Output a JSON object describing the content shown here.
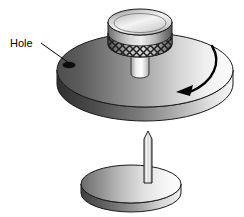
{
  "figure": {
    "type": "technical-line-illustration",
    "background_color": "#ffffff",
    "width": 244,
    "height": 217
  },
  "annotations": {
    "hole_label": {
      "text": "Hole",
      "x": 10,
      "y": 47,
      "font_size": 11,
      "color": "#000000"
    },
    "leader_line": {
      "from_x": 41,
      "from_y": 44,
      "to_x": 68,
      "to_y": 64,
      "color": "#000000"
    },
    "rotation_arrow": {
      "description": "curved clockwise rotation arrow over upper disc",
      "direction": "clockwise",
      "arrowhead_x": 176,
      "arrowhead_y": 92,
      "color": "#000000"
    }
  },
  "parts": {
    "knob": {
      "name": "knurled knob",
      "top_ellipse_cx": 140,
      "top_ellipse_cy": 22,
      "top_rx": 32,
      "top_ry": 13,
      "body_bottom_y": 55,
      "knurl_pattern": "cross-hatch diamond",
      "fill_light": "#f2f2f2",
      "fill_dark": "#4a4a4a"
    },
    "knob_shaft": {
      "name": "knob shaft",
      "x": 131,
      "y": 52,
      "width": 18,
      "height": 26,
      "fill_light": "#fafafa",
      "fill_dark": "#9a9a9a"
    },
    "upper_disc": {
      "name": "upper rotating disc",
      "cx": 145,
      "cy": 70,
      "rx": 88,
      "ry": 37,
      "thickness": 14,
      "fill_left": "#545454",
      "fill_right": "#fbfbfb",
      "rim_fill_dark": "#3c3c3c"
    },
    "hole": {
      "name": "hole in upper disc",
      "cx": 69,
      "cy": 65,
      "rx": 6,
      "ry": 3,
      "fill": "#111111"
    },
    "lower_disc": {
      "name": "lower disc",
      "cx": 131,
      "cy": 184,
      "rx": 50,
      "ry": 19,
      "thickness": 9,
      "fill_left": "#6d6d6d",
      "fill_right": "#fbfbfb",
      "rim_fill_dark": "#4a4a4a"
    },
    "pin": {
      "name": "vertical pin",
      "x": 144,
      "tip_y": 131,
      "base_y": 184,
      "width": 8,
      "fill_light": "#fdfdfd",
      "fill_dark": "#8c8c8c"
    }
  }
}
